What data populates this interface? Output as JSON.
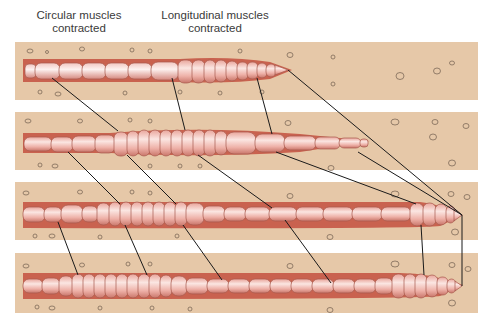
{
  "labels": {
    "circular": "Circular muscles contracted",
    "circular_line1": "Circular muscles",
    "circular_line2": "contracted",
    "longitudinal_line1": "Longitudinal muscles",
    "longitudinal_line2": "contracted"
  },
  "colors": {
    "soil": "#e6c8a8",
    "burrow": "#c9624f",
    "worm_light": "#f7dcd8",
    "worm_mid": "#e89a90",
    "worm_edge": "#9c4a3e",
    "leader_line": "#1a1a1a",
    "pebble": "#7d6a58"
  },
  "panels": [
    {
      "name": "stage-1",
      "y": 42,
      "h": 58
    },
    {
      "name": "stage-2",
      "y": 112,
      "h": 58
    },
    {
      "name": "stage-3",
      "y": 182,
      "h": 58
    },
    {
      "name": "stage-4",
      "y": 253,
      "h": 60
    }
  ]
}
